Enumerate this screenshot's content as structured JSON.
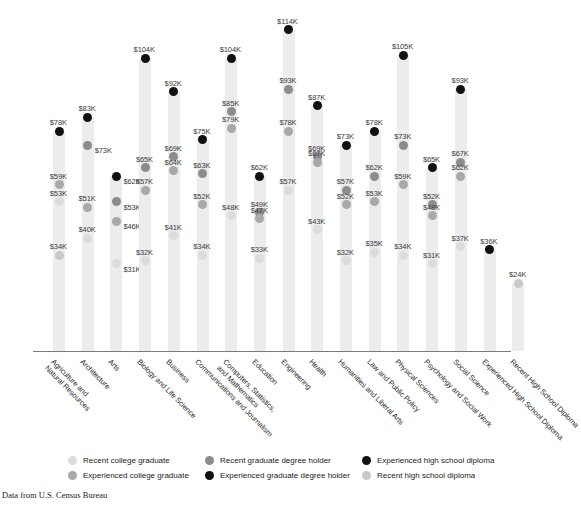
{
  "title": "",
  "source_note": "Data from U.S. Census Bureau",
  "legend": {
    "position": "bottom",
    "items": [
      {
        "label": "Recent college graduate",
        "key": "recent_college",
        "color": "#dcdcdc"
      },
      {
        "label": "Experienced college graduate",
        "key": "experienced_college",
        "color": "#a9a9a9"
      },
      {
        "label": "Recent graduate degree holder",
        "key": "recent_grad_degree",
        "color": "#8c8c8c"
      },
      {
        "label": "Experienced graduate degree holder",
        "key": "experienced_grad_degree",
        "color": "#111111"
      },
      {
        "label": "Experienced high school diploma",
        "key": "experienced_hs",
        "color": "#111111"
      },
      {
        "label": "Recent high school diploma",
        "key": "recent_hs",
        "color": "#c9c9c9"
      }
    ]
  },
  "chart_data": {
    "type": "scatter",
    "title": "",
    "xlabel": "",
    "ylabel": "Median annual wage",
    "ylim": [
      0,
      120
    ],
    "grid": false,
    "value_unit": "K",
    "value_prefix": "$",
    "categories": [
      "Agriculture and Natural Resources",
      "Architecture",
      "Arts",
      "Biology and Life Science",
      "Business",
      "Communications and Journalism",
      "Computers, Statistics, and Mathematics",
      "Education",
      "Engineering",
      "Health",
      "Humanities and Liberal Arts",
      "Law and Public Policy",
      "Physical Sciences",
      "Psychology and Social Work",
      "Social Science",
      "Experienced High School Diploma",
      "Recent High School Diploma"
    ],
    "columns": [
      {
        "category": "Agriculture and Natural Resources",
        "points": [
          {
            "series": "experienced_grad_degree",
            "value": 78,
            "label": "$78K",
            "side": "left"
          },
          {
            "series": "experienced_college",
            "value": 59,
            "label": "$59K",
            "side": "left"
          },
          {
            "series": "recent_college",
            "value": 53,
            "label": "$53K",
            "side": "left"
          },
          {
            "series": "recent_hs",
            "value": 34,
            "label": "$34K",
            "side": "left"
          }
        ]
      },
      {
        "category": "Architecture",
        "points": [
          {
            "series": "experienced_grad_degree",
            "value": 83,
            "label": "$83K",
            "side": "left"
          },
          {
            "series": "recent_grad_degree",
            "value": 73,
            "label": "$73K",
            "side": "right"
          },
          {
            "series": "experienced_college",
            "value": 51,
            "label": "$51K",
            "side": "left"
          },
          {
            "series": "recent_college",
            "value": 40,
            "label": "$40K",
            "side": "left"
          }
        ]
      },
      {
        "category": "Arts",
        "points": [
          {
            "series": "experienced_grad_degree",
            "value": 62,
            "label": "$62K",
            "side": "right"
          },
          {
            "series": "recent_grad_degree",
            "value": 53,
            "label": "$53K",
            "side": "right"
          },
          {
            "series": "experienced_college",
            "value": 46,
            "label": "$46K",
            "side": "right"
          },
          {
            "series": "recent_college",
            "value": 31,
            "label": "$31K",
            "side": "right"
          }
        ]
      },
      {
        "category": "Biology and Life Science",
        "points": [
          {
            "series": "experienced_grad_degree",
            "value": 104,
            "label": "$104K",
            "side": "left"
          },
          {
            "series": "recent_grad_degree",
            "value": 65,
            "label": "$65K",
            "side": "left"
          },
          {
            "series": "experienced_college",
            "value": 57,
            "label": "$57K",
            "side": "left"
          },
          {
            "series": "recent_college",
            "value": 32,
            "label": "$32K",
            "side": "left"
          }
        ]
      },
      {
        "category": "Business",
        "points": [
          {
            "series": "experienced_grad_degree",
            "value": 92,
            "label": "$92K",
            "side": "left"
          },
          {
            "series": "recent_grad_degree",
            "value": 69,
            "label": "$69K",
            "side": "left"
          },
          {
            "series": "experienced_college",
            "value": 64,
            "label": "$64K",
            "side": "left"
          },
          {
            "series": "recent_college",
            "value": 41,
            "label": "$41K",
            "side": "left"
          }
        ]
      },
      {
        "category": "Communications and Journalism",
        "points": [
          {
            "series": "experienced_grad_degree",
            "value": 75,
            "label": "$75K",
            "side": "left"
          },
          {
            "series": "recent_grad_degree",
            "value": 63,
            "label": "$63K",
            "side": "left"
          },
          {
            "series": "experienced_college",
            "value": 52,
            "label": "$52K",
            "side": "left"
          },
          {
            "series": "recent_college",
            "value": 34,
            "label": "$34K",
            "side": "left"
          }
        ]
      },
      {
        "category": "Computers, Statistics, and Mathematics",
        "points": [
          {
            "series": "experienced_grad_degree",
            "value": 104,
            "label": "$104K",
            "side": "left"
          },
          {
            "series": "recent_grad_degree",
            "value": 85,
            "label": "$85K",
            "side": "left"
          },
          {
            "series": "experienced_college",
            "value": 79,
            "label": "$79K",
            "side": "left"
          },
          {
            "series": "recent_college",
            "value": 48,
            "label": "$48K",
            "side": "left"
          }
        ]
      },
      {
        "category": "Education",
        "points": [
          {
            "series": "experienced_grad_degree",
            "value": 62,
            "label": "$62K",
            "side": "left"
          },
          {
            "series": "recent_grad_degree",
            "value": 49,
            "label": "$49K",
            "side": "left"
          },
          {
            "series": "experienced_college",
            "value": 47,
            "label": "$47K",
            "side": "left"
          },
          {
            "series": "recent_college",
            "value": 33,
            "label": "$33K",
            "side": "left"
          }
        ]
      },
      {
        "category": "Engineering",
        "points": [
          {
            "series": "experienced_grad_degree",
            "value": 114,
            "label": "$114K",
            "side": "left"
          },
          {
            "series": "recent_grad_degree",
            "value": 93,
            "label": "$93K",
            "side": "left"
          },
          {
            "series": "experienced_college",
            "value": 78,
            "label": "$78K",
            "side": "left"
          },
          {
            "series": "recent_college",
            "value": 57,
            "label": "$57K",
            "side": "left"
          }
        ]
      },
      {
        "category": "Health",
        "points": [
          {
            "series": "experienced_grad_degree",
            "value": 87,
            "label": "$87K",
            "side": "left"
          },
          {
            "series": "recent_grad_degree",
            "value": 69,
            "label": "$69K",
            "side": "left"
          },
          {
            "series": "experienced_college",
            "value": 67,
            "label": "$67K",
            "side": "left"
          },
          {
            "series": "recent_college",
            "value": 43,
            "label": "$43K",
            "side": "left"
          }
        ]
      },
      {
        "category": "Humanities and Liberal Arts",
        "points": [
          {
            "series": "experienced_grad_degree",
            "value": 73,
            "label": "$73K",
            "side": "left"
          },
          {
            "series": "recent_grad_degree",
            "value": 57,
            "label": "$57K",
            "side": "left"
          },
          {
            "series": "experienced_college",
            "value": 52,
            "label": "$52K",
            "side": "left"
          },
          {
            "series": "recent_college",
            "value": 32,
            "label": "$32K",
            "side": "left"
          }
        ]
      },
      {
        "category": "Law and Public Policy",
        "points": [
          {
            "series": "experienced_grad_degree",
            "value": 78,
            "label": "$78K",
            "side": "left"
          },
          {
            "series": "recent_grad_degree",
            "value": 62,
            "label": "$62K",
            "side": "left"
          },
          {
            "series": "experienced_college",
            "value": 53,
            "label": "$53K",
            "side": "left"
          },
          {
            "series": "recent_college",
            "value": 35,
            "label": "$35K",
            "side": "left"
          }
        ]
      },
      {
        "category": "Physical Sciences",
        "points": [
          {
            "series": "experienced_grad_degree",
            "value": 105,
            "label": "$105K",
            "side": "left"
          },
          {
            "series": "recent_grad_degree",
            "value": 73,
            "label": "$73K",
            "side": "left"
          },
          {
            "series": "experienced_college",
            "value": 59,
            "label": "$59K",
            "side": "left"
          },
          {
            "series": "recent_college",
            "value": 34,
            "label": "$34K",
            "side": "left"
          }
        ]
      },
      {
        "category": "Psychology and Social Work",
        "points": [
          {
            "series": "experienced_grad_degree",
            "value": 65,
            "label": "$65K",
            "side": "left"
          },
          {
            "series": "recent_grad_degree",
            "value": 52,
            "label": "$52K",
            "side": "left"
          },
          {
            "series": "experienced_college",
            "value": 48,
            "label": "$48K",
            "side": "left"
          },
          {
            "series": "recent_college",
            "value": 31,
            "label": "$31K",
            "side": "left"
          }
        ]
      },
      {
        "category": "Social Science",
        "points": [
          {
            "series": "experienced_grad_degree",
            "value": 93,
            "label": "$93K",
            "side": "left"
          },
          {
            "series": "recent_grad_degree",
            "value": 67,
            "label": "$67K",
            "side": "left"
          },
          {
            "series": "experienced_college",
            "value": 62,
            "label": "$62K",
            "side": "left"
          },
          {
            "series": "recent_college",
            "value": 37,
            "label": "$37K",
            "side": "left"
          }
        ]
      },
      {
        "category": "Experienced High School Diploma",
        "points": [
          {
            "series": "experienced_hs",
            "value": 36,
            "label": "$36K",
            "side": "left"
          }
        ]
      },
      {
        "category": "Recent High School Diploma",
        "points": [
          {
            "series": "recent_hs",
            "value": 24,
            "label": "$24K",
            "side": "left"
          }
        ]
      }
    ]
  }
}
